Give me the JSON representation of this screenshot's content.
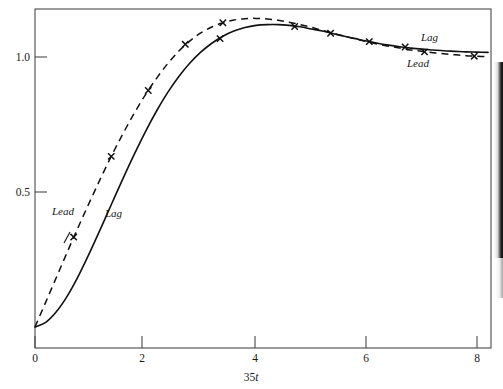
{
  "figure": {
    "title": "",
    "caption": "",
    "background": "#ffffff",
    "ink_color": "#111111"
  },
  "axes": {
    "x": {
      "label_prefix": "35",
      "label_italic": "t",
      "label_full": "35t",
      "ticks": [
        0,
        2,
        4,
        6,
        8
      ],
      "tick_labels": [
        "0",
        "2",
        "4",
        "6",
        "8"
      ],
      "range": [
        0,
        8.2
      ]
    },
    "y": {
      "label": "",
      "ticks": [
        0.5,
        1.0
      ],
      "tick_labels": [
        "0.5",
        "1.0"
      ],
      "range": [
        -0.08,
        1.22
      ]
    },
    "frame": "box"
  },
  "annotations": {
    "left_lead": "Lead",
    "left_lag": "Lag",
    "right_lag": "Lag",
    "right_lead": "Lead"
  },
  "chart_data": {
    "type": "line",
    "title": "",
    "xlabel": "35t",
    "ylabel": "",
    "xlim": [
      0,
      8.2
    ],
    "ylim": [
      -0.08,
      1.22
    ],
    "grid": false,
    "legend": "inline-annotations",
    "marker": "x",
    "series": [
      {
        "name": "Lag",
        "style": "solid",
        "color": "#111111",
        "x": [
          0.0,
          0.2,
          0.4,
          0.6,
          0.8,
          1.0,
          1.2,
          1.4,
          1.6,
          1.8,
          2.0,
          2.2,
          2.4,
          2.6,
          2.8,
          3.0,
          3.2,
          3.4,
          3.6,
          3.8,
          4.0,
          4.2,
          4.4,
          4.6,
          4.8,
          5.0,
          5.2,
          5.4,
          5.6,
          5.8,
          6.0,
          6.2,
          6.4,
          6.6,
          6.8,
          7.0,
          7.2,
          7.4,
          7.6,
          7.8,
          8.0,
          8.2
        ],
        "y": [
          0.0,
          0.018,
          0.06,
          0.12,
          0.195,
          0.28,
          0.37,
          0.462,
          0.553,
          0.641,
          0.724,
          0.8,
          0.868,
          0.927,
          0.977,
          1.018,
          1.051,
          1.077,
          1.096,
          1.109,
          1.117,
          1.12,
          1.12,
          1.117,
          1.112,
          1.104,
          1.096,
          1.086,
          1.077,
          1.068,
          1.059,
          1.051,
          1.044,
          1.038,
          1.033,
          1.029,
          1.026,
          1.023,
          1.021,
          1.019,
          1.018,
          1.017
        ],
        "markers_x": [
          3.35,
          4.7,
          5.35,
          6.05,
          6.7
        ],
        "markers_y": [
          1.068,
          1.113,
          1.088,
          1.057,
          1.037
        ]
      },
      {
        "name": "Lead",
        "style": "dashed",
        "color": "#111111",
        "x": [
          0.0,
          0.2,
          0.4,
          0.6,
          0.8,
          1.0,
          1.2,
          1.4,
          1.6,
          1.8,
          2.0,
          2.2,
          2.4,
          2.6,
          2.8,
          3.0,
          3.2,
          3.4,
          3.6,
          3.8,
          4.0,
          4.2,
          4.4,
          4.6,
          4.8,
          5.0,
          5.2,
          5.4,
          5.6,
          5.8,
          6.0,
          6.2,
          6.4,
          6.6,
          6.8,
          7.0,
          7.2,
          7.4,
          7.6,
          7.8,
          8.0,
          8.2
        ],
        "y": [
          0.0,
          0.095,
          0.19,
          0.285,
          0.378,
          0.468,
          0.556,
          0.64,
          0.719,
          0.793,
          0.861,
          0.921,
          0.975,
          1.021,
          1.059,
          1.089,
          1.111,
          1.127,
          1.137,
          1.142,
          1.143,
          1.141,
          1.136,
          1.129,
          1.12,
          1.11,
          1.099,
          1.088,
          1.077,
          1.067,
          1.057,
          1.048,
          1.04,
          1.033,
          1.026,
          1.021,
          1.016,
          1.012,
          1.008,
          1.005,
          1.003,
          1.001
        ],
        "markers_x": [
          0.7,
          1.38,
          2.05,
          2.72,
          3.4,
          7.05,
          7.95
        ],
        "markers_y": [
          0.333,
          0.632,
          0.876,
          1.047,
          1.127,
          1.019,
          1.003
        ]
      }
    ]
  },
  "icons": {
    "marker": "cross-x-marker"
  }
}
